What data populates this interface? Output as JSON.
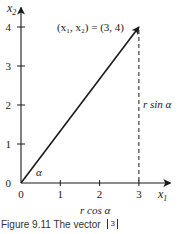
{
  "figure": {
    "axes": {
      "x_label": "x",
      "x_label_sub": "1",
      "y_label": "x",
      "y_label_sub": "2",
      "x_ticks": [
        "0",
        "1",
        "2",
        "3"
      ],
      "y_ticks": [
        "0",
        "1",
        "2",
        "3",
        "4"
      ],
      "x_range": [
        0,
        3.8
      ],
      "y_range": [
        0,
        4.5
      ]
    },
    "vector": {
      "x": 3,
      "y": 4
    },
    "point_label": "(x₁, x₂) = (3, 4)",
    "angle_label": "α",
    "vertical_label": "r sin α",
    "horizontal_label": "r cos α",
    "caption": "Figure 9.11  The vector",
    "caption_vector_entry": "3"
  }
}
